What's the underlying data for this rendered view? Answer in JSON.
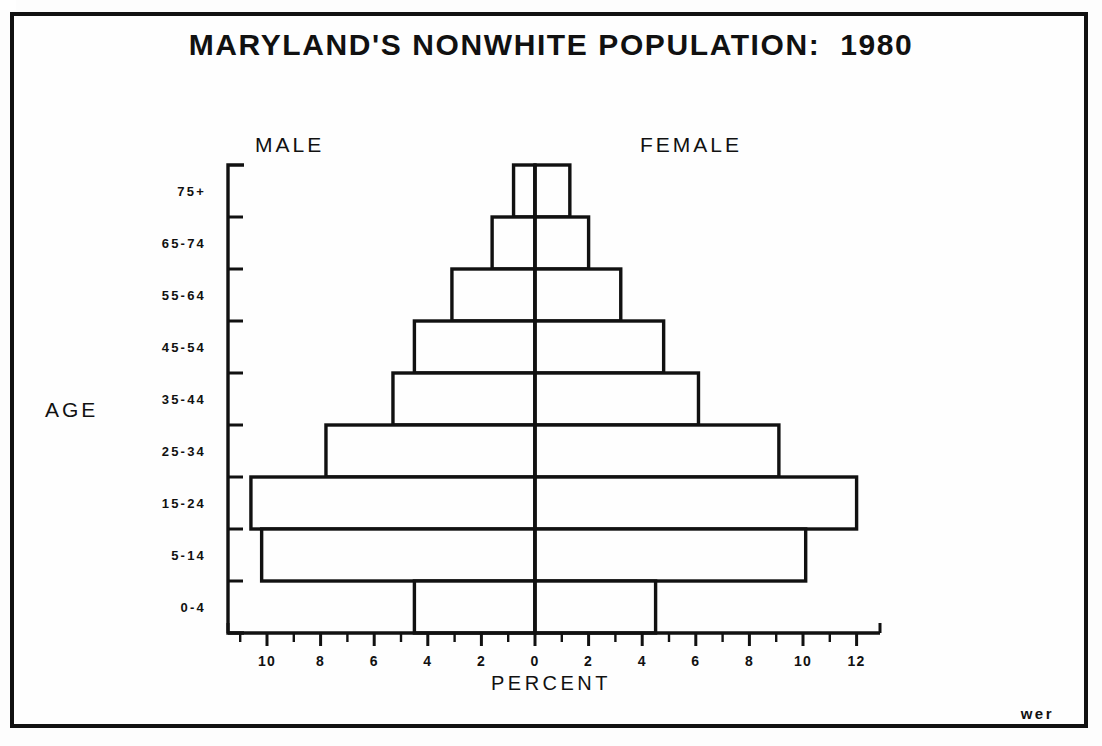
{
  "title": "MARYLAND'S NONWHITE POPULATION:  1980",
  "labels": {
    "male": "MALE",
    "female": "FEMALE",
    "age_axis": "AGE",
    "percent_axis": "PERCENT",
    "footer_mark": "wer"
  },
  "colors": {
    "ink": "#111111",
    "paper": "#fefefe"
  },
  "chart_data": {
    "type": "bar",
    "subtype": "population-pyramid",
    "title": "MARYLAND'S NONWHITE POPULATION:  1980",
    "xlabel": "PERCENT",
    "ylabel": "AGE",
    "grid": false,
    "legend": [
      "MALE",
      "FEMALE"
    ],
    "legend_position": "top-inside",
    "categories": [
      "0-4",
      "5-14",
      "15-24",
      "25-34",
      "35-44",
      "45-54",
      "55-64",
      "65-74",
      "75+"
    ],
    "xlim": [
      -11,
      13
    ],
    "xticks_major_left": [
      10,
      8,
      6,
      4,
      2
    ],
    "xtick_center": 0,
    "xticks_major_right": [
      2,
      4,
      6,
      8,
      10,
      12
    ],
    "xtick_labels": [
      "10",
      "8",
      "6",
      "4",
      "2",
      "0",
      "2",
      "4",
      "6",
      "8",
      "10",
      "12"
    ],
    "xticks_minor_step": 1,
    "series": [
      {
        "name": "MALE",
        "side": "left",
        "values": [
          4.5,
          10.2,
          10.6,
          7.8,
          5.3,
          4.5,
          3.1,
          1.6,
          0.8
        ]
      },
      {
        "name": "FEMALE",
        "side": "right",
        "values": [
          4.5,
          10.1,
          12.0,
          9.1,
          6.1,
          4.8,
          3.2,
          2.0,
          1.3
        ]
      }
    ]
  }
}
